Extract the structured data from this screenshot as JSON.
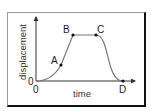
{
  "diagram": {
    "title": "",
    "x_axis_label": "time",
    "y_axis_label": "displacement",
    "origin_x_label": "0",
    "origin_y_label": "0",
    "points": [
      {
        "label": "A",
        "description": "accelerating, curve rising"
      },
      {
        "label": "B",
        "description": "start of constant displacement"
      },
      {
        "label": "C",
        "description": "end of constant displacement"
      },
      {
        "label": "D",
        "description": "return to zero displacement"
      }
    ],
    "colors": {
      "curve": "#777777",
      "axes": "#333333",
      "points": "#111111"
    }
  }
}
